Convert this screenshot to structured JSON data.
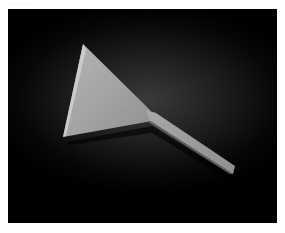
{
  "caption": {
    "text": "··· ·········"
  },
  "image": {
    "subject": "metal-scraper-tool",
    "description": "A triangular stone/metal spatula-like tool with a long handle, photographed on a dark gradient background",
    "colors": {
      "background": "#000000",
      "object": "#9a9a9a",
      "object_highlight": "#c8c8c8",
      "object_shadow": "#5a5a5a"
    }
  }
}
